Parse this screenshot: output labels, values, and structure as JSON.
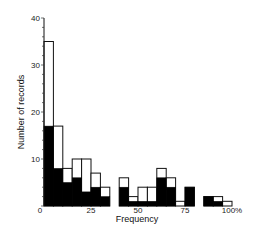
{
  "chart_data": {
    "type": "bar",
    "subtype": "overlaid-histogram",
    "title": "",
    "xlabel": "Frequency",
    "ylabel": "Number of records",
    "xlim": [
      0,
      100
    ],
    "ylim": [
      0,
      40
    ],
    "x_ticks": [
      "0",
      "25",
      "50",
      "75",
      "100%"
    ],
    "x_tick_values": [
      0,
      25,
      50,
      75,
      100
    ],
    "y_ticks": [
      "0",
      "10",
      "20",
      "30",
      "40"
    ],
    "y_tick_values": [
      0,
      10,
      20,
      30,
      40
    ],
    "y_minor_tick_step": 2,
    "grid": false,
    "legend": null,
    "bin_width": 5,
    "categories": [
      "0-5",
      "5-10",
      "10-15",
      "15-20",
      "20-25",
      "25-30",
      "30-35",
      "35-40",
      "40-45",
      "45-50",
      "50-55",
      "55-60",
      "60-65",
      "65-70",
      "70-75",
      "75-80",
      "80-85",
      "85-90",
      "90-95",
      "95-100"
    ],
    "series": [
      {
        "name": "Total (open bars)",
        "fill": "#ffffff",
        "stroke": "#111111",
        "values": [
          35,
          17,
          8,
          10,
          10,
          7,
          4,
          0,
          6,
          2,
          4,
          4,
          8,
          6,
          1,
          4,
          0,
          2,
          2,
          1
        ]
      },
      {
        "name": "Subset (filled bars)",
        "fill": "#000000",
        "values": [
          17,
          8,
          5,
          6,
          3,
          4,
          2,
          0,
          4,
          1,
          1,
          1,
          6,
          4,
          0,
          4,
          0,
          2,
          1,
          0
        ]
      }
    ]
  }
}
